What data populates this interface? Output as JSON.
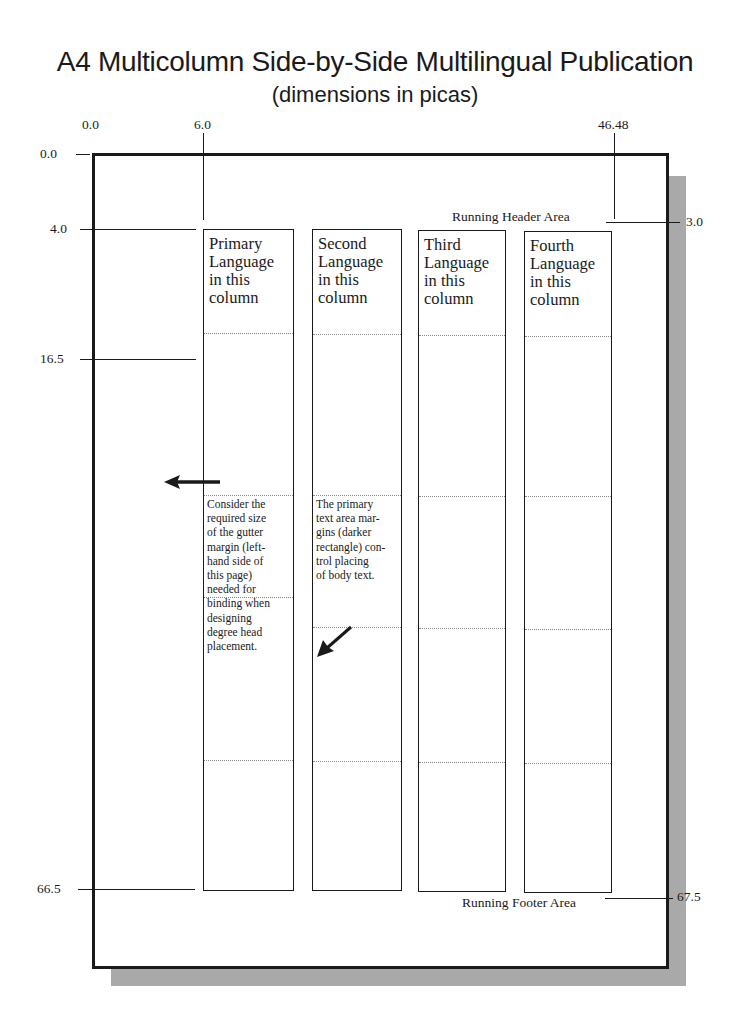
{
  "title": "A4 Multicolumn Side-by-Side Multilingual Publication",
  "subtitle": "(dimensions in picas)",
  "top_ruler": {
    "left": "0.0",
    "gutter": "6.0",
    "right": "46.48"
  },
  "left_ruler": {
    "top": "0.0",
    "text_top": "4.0",
    "head_depth": "16.5",
    "text_bottom": "66.5"
  },
  "right_ruler": {
    "header": "3.0",
    "footer": "67.5"
  },
  "areas": {
    "header": "Running Header Area",
    "footer": "Running Footer Area"
  },
  "columns": [
    {
      "heading": "Primary Language in this column",
      "note": "Consider the required size of the gutter margin (left-hand side of this page) needed for binding when designing degree head placement."
    },
    {
      "heading": "Second Language in this column",
      "note": "The primary text area margins (darker rectangle) control placing of body text."
    },
    {
      "heading": "Third Language in this column",
      "note": ""
    },
    {
      "heading": "Fourth Language in this column",
      "note": ""
    }
  ],
  "column_heading_lines": [
    [
      "Primary",
      "Language",
      "in this",
      "column"
    ],
    [
      "Second",
      "Language",
      "in this",
      "column"
    ],
    [
      "Third",
      "Language",
      "in this",
      "column"
    ],
    [
      "Fourth",
      "Language",
      "in this",
      "column"
    ]
  ],
  "note_lines": {
    "col1": [
      "Consider the",
      "required size",
      "of the gutter",
      "margin (left-",
      "hand side of",
      "this page)",
      "needed for",
      "binding when",
      "designing",
      "degree head",
      "placement."
    ],
    "col2": [
      "The primary",
      "text area mar-",
      "gins (darker",
      "rectangle) con-",
      "trol placing",
      "of body text."
    ]
  },
  "icons": {
    "left_arrow": "arrow-left-icon",
    "diagonal_arrow": "arrow-down-left-icon"
  },
  "colors": {
    "ink": "#1a1a1a",
    "shadow": "#a9a9a9",
    "guide": "#888888"
  }
}
